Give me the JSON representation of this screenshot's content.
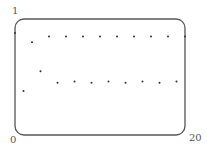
{
  "chart_data": {
    "type": "scatter",
    "title": "",
    "xlabel": "",
    "ylabel": "",
    "xlim": [
      0,
      20
    ],
    "ylim": [
      0,
      1
    ],
    "tick_labels": {
      "x_min": "0",
      "x_max": "20",
      "y_max": "1"
    },
    "grid": false,
    "series": [
      {
        "name": "sequence",
        "x": [
          0,
          1,
          2,
          3,
          4,
          5,
          6,
          7,
          8,
          9,
          10,
          11,
          12,
          13,
          14,
          15,
          16,
          17,
          18,
          19,
          20
        ],
        "y": [
          0.88,
          0.38,
          0.8,
          0.55,
          0.85,
          0.45,
          0.85,
          0.46,
          0.85,
          0.45,
          0.85,
          0.46,
          0.85,
          0.45,
          0.85,
          0.46,
          0.85,
          0.45,
          0.85,
          0.46,
          0.85
        ]
      }
    ]
  },
  "labels": {
    "y_top": "1",
    "origin": "0",
    "x_right": "20"
  },
  "colors": {
    "frame": "#555555",
    "points": "#333333"
  }
}
